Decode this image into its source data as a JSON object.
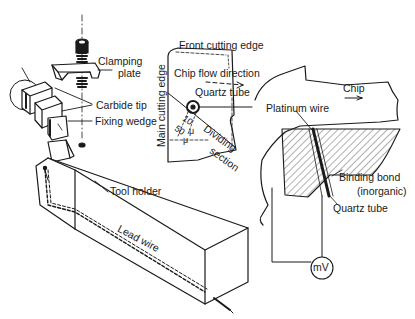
{
  "diagram": {
    "type": "technical-illustration",
    "colors": {
      "ink": "#1a1a1a",
      "background": "#ffffff"
    },
    "labels": {
      "clamping_plate_1": "Clamping",
      "clamping_plate_2": "plate",
      "carbide_tip": "Carbide tip",
      "fixing_wedge": "Fixing wedge",
      "tool_holder": "Tool holder",
      "lead_wire": "Lead wire",
      "front_cutting_edge": "Front cutting edge",
      "main_cutting_edge": "Main cutting edge",
      "chip_flow_direction": "Chip flow direction",
      "quartz_tube_top": "Quartz tube",
      "dividing": "Dividing",
      "section": "section",
      "dim_10": "10",
      "dim_50": "50",
      "dim_unit": "μ",
      "platinum_wire": "Platinum wire",
      "chip": "Chip",
      "binding_bond_1": "Binding bond",
      "binding_bond_2": "(inorganic)",
      "quartz_tube_bottom": "Quartz tube",
      "millivoltmeter": "mV"
    },
    "components": [
      "clamping-screw",
      "clamping-plate",
      "carbide-tip",
      "fixing-wedge",
      "tool-holder",
      "lead-wire",
      "insert-top-view",
      "cross-section-view",
      "millivoltmeter"
    ]
  }
}
